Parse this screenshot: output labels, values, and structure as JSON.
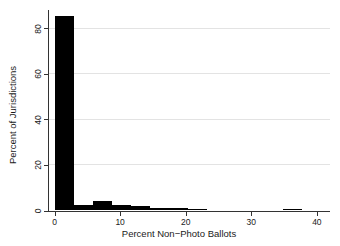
{
  "chart_data": {
    "type": "bar",
    "subtype": "histogram",
    "title": "",
    "xlabel": "Percent Non−Photo Ballots",
    "ylabel": "Percent of Jurisdictions",
    "x_ticks": [
      0,
      10,
      20,
      30,
      40
    ],
    "y_ticks": [
      0,
      20,
      40,
      60,
      80
    ],
    "xlim": [
      -1,
      42
    ],
    "ylim": [
      0,
      88
    ],
    "grid": "horizontal-only",
    "legend": "none",
    "bar_color": "#000000",
    "bin_width": 2.9,
    "bins": [
      {
        "x0": 0,
        "x1": 2.9,
        "pct": 85.5
      },
      {
        "x0": 2.9,
        "x1": 5.8,
        "pct": 2.5
      },
      {
        "x0": 5.8,
        "x1": 8.7,
        "pct": 4.2
      },
      {
        "x0": 8.7,
        "x1": 11.6,
        "pct": 2.2
      },
      {
        "x0": 11.6,
        "x1": 14.5,
        "pct": 1.9
      },
      {
        "x0": 14.5,
        "x1": 17.4,
        "pct": 1.3
      },
      {
        "x0": 17.4,
        "x1": 20.3,
        "pct": 0.9
      },
      {
        "x0": 20.3,
        "x1": 23.2,
        "pct": 0.6
      },
      {
        "x0": 34.8,
        "x1": 37.7,
        "pct": 0.7
      }
    ]
  },
  "colors": {
    "background": "#ffffff",
    "axis": "#333333",
    "gridline": "#e3e3e3",
    "bar": "#000000",
    "text": "#1a1a1a"
  }
}
